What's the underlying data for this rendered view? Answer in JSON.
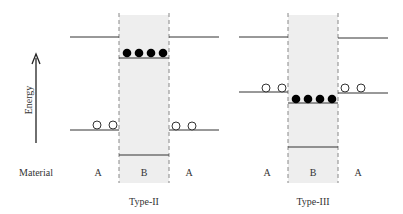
{
  "axis": {
    "ylabel": "Energy",
    "row_label": "Material"
  },
  "panels": [
    {
      "title": "Type-II",
      "materials": [
        "A",
        "B",
        "A"
      ],
      "levels": {
        "A_upper": 37,
        "A_lower": 130,
        "B_upper": 58,
        "B_lower": 155
      },
      "electrons_on": "B_upper",
      "electron_count": 4,
      "holes_on": "A_lower",
      "hole_count_per_side": 2
    },
    {
      "title": "Type-III",
      "materials": [
        "A",
        "B",
        "A"
      ],
      "levels": {
        "A_upper": 37,
        "A_lower": 92,
        "B_upper": 103,
        "B_lower": 147
      },
      "electrons_on": "B_upper",
      "electron_count": 4,
      "holes_on": "A_lower",
      "hole_count_per_side": 2
    }
  ],
  "colors": {
    "line": "#333333",
    "shade": "#eeeeee",
    "dash": "#888888",
    "electron": "#000000",
    "hole_fill": "#ffffff"
  }
}
